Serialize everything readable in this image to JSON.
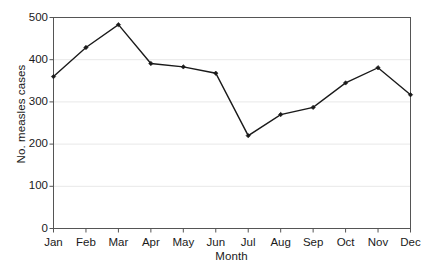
{
  "chart_data": {
    "type": "line",
    "title": "",
    "subtitle": "",
    "xlabel": "Month",
    "ylabel": "No. measles cases",
    "categories": [
      "Jan",
      "Feb",
      "Mar",
      "Apr",
      "May",
      "Jun",
      "Jul",
      "Aug",
      "Sep",
      "Oct",
      "Nov",
      "Dec"
    ],
    "values": [
      360,
      429,
      483,
      391,
      383,
      368,
      220,
      270,
      287,
      345,
      381,
      317
    ],
    "series": [
      {
        "name": "No. measles cases",
        "values": [
          360,
          429,
          483,
          391,
          383,
          368,
          220,
          270,
          287,
          345,
          381,
          317
        ]
      }
    ],
    "ylim": [
      0,
      500
    ],
    "yticks": [
      0,
      100,
      200,
      300,
      400,
      500
    ],
    "ytick_labels": [
      "0",
      "100",
      "200",
      "300",
      "400",
      "500"
    ],
    "xtick_labels": [
      "Jan",
      "Feb",
      "Mar",
      "Apr",
      "May",
      "Jun",
      "Jul",
      "Aug",
      "Sep",
      "Oct",
      "Nov",
      "Dec"
    ],
    "grid": true,
    "grid_axis": "y",
    "legend": false,
    "legend_position": "none",
    "marker": "diamond",
    "line_color": "#1a1a1a",
    "marker_color": "#1a1a1a",
    "grid_color": "#e8e8e8",
    "axis_color": "#555555",
    "background_color": "#ffffff",
    "annotations": []
  },
  "axes": {
    "y_title": "No. measles cases",
    "x_title": "Month"
  }
}
